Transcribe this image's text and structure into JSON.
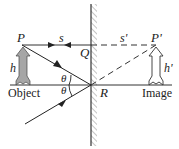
{
  "diagram": {
    "labels": {
      "object_point": "P",
      "image_point": "P'",
      "mirror_top_point": "Q",
      "mirror_reflection_point": "R",
      "object_distance": "s",
      "image_distance": "s'",
      "object_height": "h",
      "image_height": "h'",
      "angle_incident": "θ",
      "angle_reflected": "θ",
      "object_caption": "Object",
      "image_caption": "Image"
    },
    "colors": {
      "line": "#222222",
      "arrow_fill": "#a6a6a6",
      "hatch": "#777777",
      "background": "#ffffff"
    }
  }
}
